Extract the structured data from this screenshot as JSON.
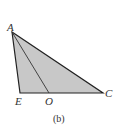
{
  "figure": {
    "caption": "(b)",
    "fill_color": "#c8c8c8",
    "stroke_color": "#222222",
    "points": {
      "A": {
        "label": "A",
        "x": 12,
        "y": 32
      },
      "E": {
        "label": "E",
        "x": 20,
        "y": 93
      },
      "O": {
        "label": "O",
        "x": 49,
        "y": 93
      },
      "C": {
        "label": "C",
        "x": 103,
        "y": 93
      }
    },
    "segments": [
      "AE",
      "EC",
      "CA",
      "AO"
    ],
    "shaded_region": "triangle AEC"
  }
}
